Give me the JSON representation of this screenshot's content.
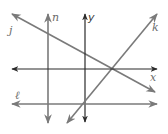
{
  "figure": {
    "colors": {
      "line": "#7a7a7a",
      "axis": "#2a2a2a",
      "label": "#6b6b6b"
    },
    "labels": {
      "j": "j",
      "n": "n",
      "y": "y",
      "k": "k",
      "x": "x",
      "l": "ℓ"
    },
    "lines": [
      {
        "name": "j",
        "x1": 12,
        "y1": 14,
        "x2": 155,
        "y2": 92,
        "type": "line"
      },
      {
        "name": "n",
        "x1": 48,
        "y1": 14,
        "x2": 48,
        "y2": 123,
        "type": "line"
      },
      {
        "name": "y",
        "x1": 85,
        "y1": 14,
        "x2": 85,
        "y2": 122,
        "type": "axis"
      },
      {
        "name": "k",
        "x1": 67,
        "y1": 123,
        "x2": 157,
        "y2": 14,
        "type": "line"
      },
      {
        "name": "x",
        "x1": 12,
        "y1": 69,
        "x2": 157,
        "y2": 69,
        "type": "axis"
      },
      {
        "name": "l",
        "x1": 12,
        "y1": 104,
        "x2": 157,
        "y2": 104,
        "type": "line"
      }
    ]
  }
}
